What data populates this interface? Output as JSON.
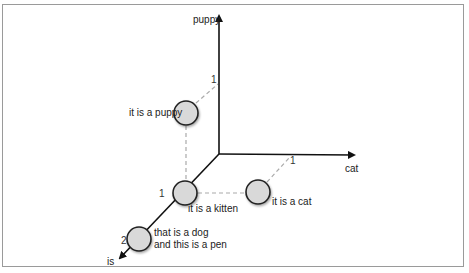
{
  "diagram": {
    "type": "3d-vector-space",
    "axes": [
      {
        "name": "puppy",
        "label": "puppy",
        "tick": "1"
      },
      {
        "name": "cat",
        "label": "cat",
        "tick": "1"
      },
      {
        "name": "is",
        "label": "is",
        "ticks": [
          "1",
          "2"
        ]
      }
    ],
    "points": [
      {
        "label": "it is a puppy",
        "coords": {
          "is": 1,
          "puppy": 1,
          "cat": 0
        }
      },
      {
        "label": "it is a kitten",
        "coords": {
          "is": 1,
          "puppy": 0,
          "cat": 0
        }
      },
      {
        "label": "it is a cat",
        "coords": {
          "is": 1,
          "puppy": 0,
          "cat": 1
        }
      },
      {
        "label_line1": "that is a dog",
        "label_line2": "and this is a pen",
        "coords": {
          "is": 2,
          "puppy": 0,
          "cat": 0
        }
      }
    ],
    "colors": {
      "axis": "#111111",
      "circle_fill": "#d9d9d9",
      "circle_stroke": "#222222",
      "dashed": "#aaaaaa",
      "frame": "#9a9a9a"
    }
  }
}
